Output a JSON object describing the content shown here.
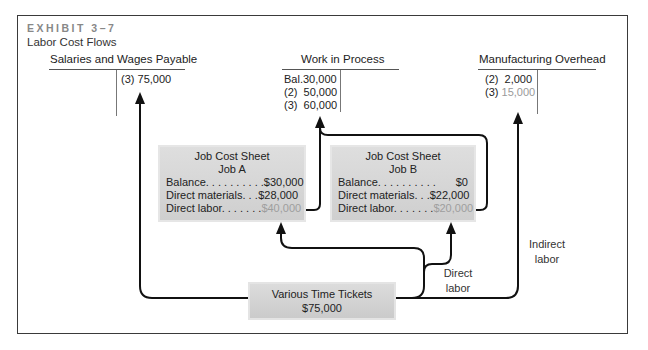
{
  "exhibit": {
    "number": "EXHIBIT 3–7",
    "title": "Labor Cost Flows"
  },
  "accounts": {
    "salaries": {
      "title": "Salaries and Wages Payable",
      "credit_entries": [
        {
          "ref": "(3)",
          "amount": "75,000"
        }
      ]
    },
    "wip": {
      "title": "Work in Process",
      "debit_entries": [
        {
          "ref": "Bal.",
          "amount": "30,000"
        },
        {
          "ref": "(2)",
          "amount": "50,000"
        },
        {
          "ref": "(3)",
          "amount": "60,000"
        }
      ]
    },
    "overhead": {
      "title": "Manufacturing Overhead",
      "debit_entries": [
        {
          "ref": "(2)",
          "amount": "2,000"
        },
        {
          "ref": "(3)",
          "amount": "15,000"
        }
      ]
    }
  },
  "job_sheets": [
    {
      "title": "Job Cost Sheet",
      "job": "Job A",
      "rows": [
        {
          "label": "Balance. . . . . . . . . .",
          "value": "$30,000"
        },
        {
          "label": "Direct materials. . .",
          "value": "$28,000"
        },
        {
          "label": "Direct labor. . . . . . .",
          "value": "$40,000"
        }
      ]
    },
    {
      "title": "Job Cost Sheet",
      "job": "Job B",
      "rows": [
        {
          "label": "Balance. . . . . . . . . .",
          "value": "$0"
        },
        {
          "label": "Direct materials. . .",
          "value": "$22,000"
        },
        {
          "label": "Direct labor. . . . . . .",
          "value": "$20,000"
        }
      ]
    }
  ],
  "time_tickets": {
    "title": "Various Time Tickets",
    "amount": "$75,000"
  },
  "flow_labels": {
    "direct_line1": "Direct",
    "direct_line2": "labor",
    "indirect_line1": "Indirect",
    "indirect_line2": "labor"
  },
  "colors": {
    "border": "#3a3a3a",
    "box_fill": "#d6d6d6",
    "highlight_text": "#9e9e9e",
    "exhibit_label": "#888888"
  }
}
